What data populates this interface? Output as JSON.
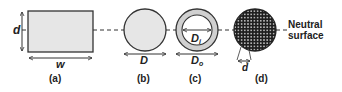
{
  "figure": {
    "panels": [
      {
        "id": "a",
        "caption": "(a)",
        "shape": "rectangle",
        "dims": [
          "d",
          "w"
        ]
      },
      {
        "id": "b",
        "caption": "(b)",
        "shape": "solid circle",
        "dims": [
          "D"
        ]
      },
      {
        "id": "c",
        "caption": "(c)",
        "shape": "hollow circle",
        "dims": [
          "Di",
          "Do"
        ]
      },
      {
        "id": "d",
        "caption": "(d)",
        "shape": "fiber bundle circle",
        "dims": [
          "d"
        ]
      }
    ],
    "labels": {
      "a_height": "d",
      "a_width": "w",
      "b_diameter": "D",
      "c_inner_main": "D",
      "c_inner_sub": "i",
      "c_outer_main": "D",
      "c_outer_sub": "o",
      "d_fiber": "d",
      "neutral_line1": "Neutral",
      "neutral_line2": "surface",
      "cap_a": "(a)",
      "cap_b": "(b)",
      "cap_c": "(c)",
      "cap_d": "(d)"
    },
    "colors": {
      "fill": "#e6e6e6",
      "stroke": "#333333",
      "fiber_bg": "#1e1e1e",
      "fiber_dot": "#d8d8d8"
    }
  }
}
